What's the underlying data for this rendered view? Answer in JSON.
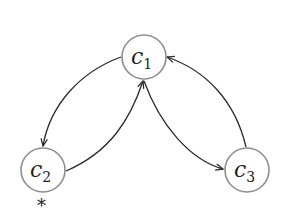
{
  "diagram": {
    "type": "directed-graph",
    "colors": {
      "node_stroke": "#8f8f8f",
      "edge_stroke": "#2a2a2a",
      "text": "#222222",
      "background": "#ffffff"
    },
    "nodes": [
      {
        "id": "c1",
        "letter": "c",
        "subscript": "1",
        "cx": 144,
        "cy": 57,
        "r": 22
      },
      {
        "id": "c2",
        "letter": "c",
        "subscript": "2",
        "cx": 43,
        "cy": 170,
        "r": 22
      },
      {
        "id": "c3",
        "letter": "c",
        "subscript": "3",
        "cx": 247,
        "cy": 170,
        "r": 22
      }
    ],
    "edges": [
      {
        "from": "c1",
        "to": "c2"
      },
      {
        "from": "c2",
        "to": "c1"
      },
      {
        "from": "c1",
        "to": "c3"
      },
      {
        "from": "c3",
        "to": "c1"
      }
    ],
    "annotations": [
      {
        "target": "c2",
        "text": "*"
      }
    ]
  }
}
